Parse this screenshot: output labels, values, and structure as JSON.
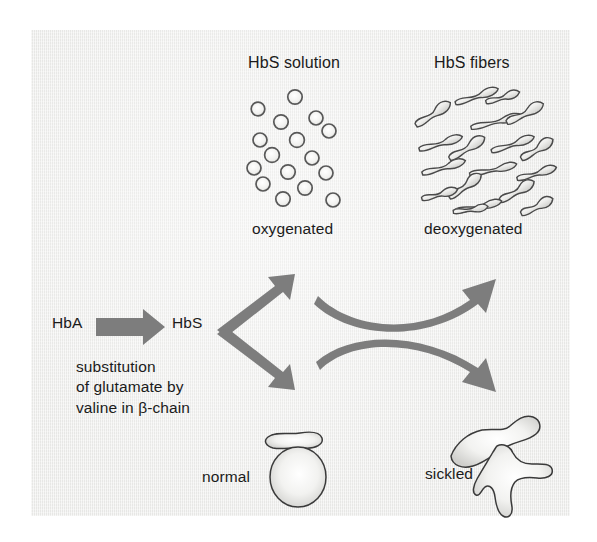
{
  "figure": {
    "panel_background_color": "#ededeb",
    "arrow_color": "#7d7d7d",
    "text_color": "#1b1b1b",
    "outline_color": "#3a3a3a"
  },
  "labels": {
    "hbs_solution": "HbS solution",
    "hbs_fibers": "HbS fibers",
    "oxygenated": "oxygenated",
    "deoxygenated": "deoxygenated",
    "hba": "HbA",
    "hbs": "HbS",
    "substitution": "substitution of glutamate by valine in β-chain",
    "substitution_lines": [
      "substitution",
      "of glutamate by",
      "valine in β-chain"
    ],
    "normal": "normal",
    "sickled": "sickled"
  },
  "arrows": {
    "hba_to_hbs": {
      "name": "mutation-arrow",
      "direction": "right",
      "from": "HbA",
      "to": "HbS"
    },
    "branch_up": {
      "name": "branch-arrow-up",
      "direction": "up-right",
      "target": "oxygenated"
    },
    "branch_down": {
      "name": "branch-arrow-down",
      "direction": "down-right",
      "target": "normal"
    },
    "curve_top": {
      "name": "deoxygenation-arrow",
      "direction": "curve-up-right",
      "from": "oxygenated HbS solution",
      "to": "deoxygenated HbS fibers"
    },
    "curve_bottom": {
      "name": "sickling-arrow",
      "direction": "curve-down-right",
      "from": "normal cell",
      "to": "sickled cell"
    }
  },
  "diagram_data": {
    "type": "diagram",
    "nodes": [
      {
        "id": "hba",
        "label": "HbA",
        "kind": "text"
      },
      {
        "id": "hbs",
        "label": "HbS",
        "kind": "text"
      },
      {
        "id": "hbs_solution",
        "label": "HbS solution",
        "state": "oxygenated",
        "depiction": "scattered circles",
        "count": 16
      },
      {
        "id": "hbs_fibers",
        "label": "HbS fibers",
        "state": "deoxygenated",
        "depiction": "elongated wavy fibers",
        "count": 18
      },
      {
        "id": "normal_cell",
        "label": "normal",
        "depiction": "biconcave disc and circle",
        "count": 2
      },
      {
        "id": "sickled_cell",
        "label": "sickled",
        "depiction": "crescent / irregular sickled shapes",
        "count": 2
      }
    ],
    "edges": [
      {
        "from": "hba",
        "to": "hbs",
        "label": "substitution of glutamate by valine in β-chain"
      },
      {
        "from": "hbs",
        "to": "hbs_solution",
        "label": ""
      },
      {
        "from": "hbs",
        "to": "normal_cell",
        "label": ""
      },
      {
        "from": "hbs_solution",
        "to": "hbs_fibers",
        "label": ""
      },
      {
        "from": "normal_cell",
        "to": "sickled_cell",
        "label": ""
      }
    ]
  },
  "hb_circles": [
    {
      "cx": 295,
      "cy": 97,
      "r": 7.2
    },
    {
      "cx": 258,
      "cy": 109,
      "r": 6.8
    },
    {
      "cx": 316,
      "cy": 118,
      "r": 7.0
    },
    {
      "cx": 281,
      "cy": 122,
      "r": 7.2
    },
    {
      "cx": 260,
      "cy": 140,
      "r": 7.0
    },
    {
      "cx": 297,
      "cy": 140,
      "r": 7.4
    },
    {
      "cx": 329,
      "cy": 131,
      "r": 7.0
    },
    {
      "cx": 272,
      "cy": 155,
      "r": 7.4
    },
    {
      "cx": 312,
      "cy": 158,
      "r": 7.0
    },
    {
      "cx": 254,
      "cy": 168,
      "r": 7.0
    },
    {
      "cx": 288,
      "cy": 172,
      "r": 7.2
    },
    {
      "cx": 326,
      "cy": 173,
      "r": 7.0
    },
    {
      "cx": 263,
      "cy": 184,
      "r": 7.0
    },
    {
      "cx": 305,
      "cy": 188,
      "r": 7.2
    },
    {
      "cx": 283,
      "cy": 199,
      "r": 7.2
    },
    {
      "cx": 333,
      "cy": 200,
      "r": 7.0
    }
  ]
}
